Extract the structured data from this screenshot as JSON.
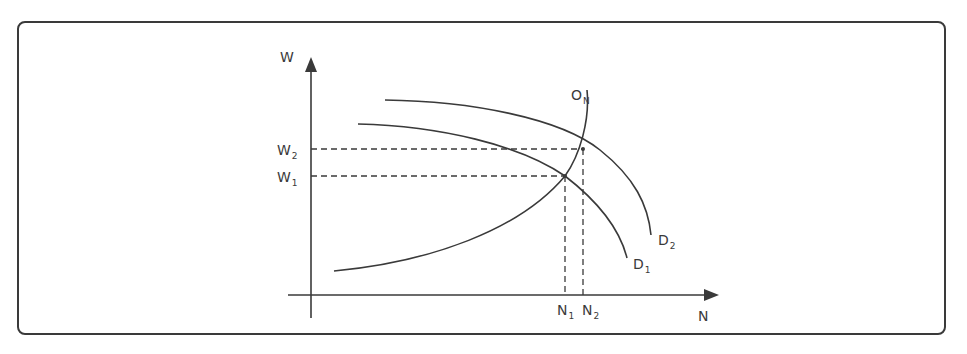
{
  "diagram": {
    "type": "labour-market supply and demand shift",
    "axes": {
      "y_label": "W",
      "x_label": "N"
    },
    "curves": [
      {
        "id": "supply",
        "label": "O",
        "subscript": "N"
      },
      {
        "id": "demand1",
        "label": "D",
        "subscript": "1"
      },
      {
        "id": "demand2",
        "label": "D",
        "subscript": "2"
      }
    ],
    "y_marks": [
      {
        "label": "W",
        "subscript": "2"
      },
      {
        "label": "W",
        "subscript": "1"
      }
    ],
    "x_marks": [
      {
        "label": "N",
        "subscript": "1"
      },
      {
        "label": "N",
        "subscript": "2"
      }
    ],
    "colors": {
      "line": "#3a3a3a",
      "background": "#ffffff"
    }
  }
}
